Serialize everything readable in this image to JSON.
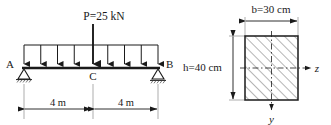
{
  "figure": {
    "stroke_color": "#1a1a1a",
    "thin_color": "#555555",
    "hatch_color": "#777777"
  },
  "beam_diagram": {
    "point_load": {
      "label": "P=25 kN",
      "symbol": "P",
      "value": "25",
      "unit": "kN"
    },
    "supports": [
      {
        "name": "A",
        "label": "A",
        "type": "pin"
      },
      {
        "name": "B",
        "label": "B",
        "type": "roller"
      }
    ],
    "points": [
      {
        "name": "C",
        "label": "C"
      }
    ],
    "dimensions": [
      {
        "name": "span-left",
        "label": "4 m",
        "value": 4,
        "unit": "m"
      },
      {
        "name": "span-right",
        "label": "4 m",
        "value": 4,
        "unit": "m"
      }
    ],
    "distributed_load": {
      "arrow_count": 9,
      "description": "uniform downward arrows along beam"
    }
  },
  "cross_section": {
    "shape": "rectangle",
    "width_label": "b=30 cm",
    "width_symbol": "b",
    "width_value": "30",
    "width_unit": "cm",
    "height_label": "h=40 cm",
    "height_symbol": "h",
    "height_value": "40",
    "height_unit": "cm",
    "axes": [
      {
        "name": "z-axis",
        "label": "z",
        "orientation": "horizontal"
      },
      {
        "name": "y-axis",
        "label": "y",
        "orientation": "vertical"
      }
    ]
  }
}
